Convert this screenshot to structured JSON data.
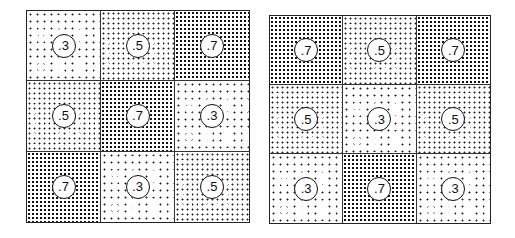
{
  "panels": [
    {
      "name": "left-panel",
      "cells": [
        {
          "label": ".3",
          "density": 3
        },
        {
          "label": ".5",
          "density": 5
        },
        {
          "label": ".7",
          "density": 7
        },
        {
          "label": ".5",
          "density": 5
        },
        {
          "label": ".7",
          "density": 7
        },
        {
          "label": ".3",
          "density": 3
        },
        {
          "label": ".7",
          "density": 7
        },
        {
          "label": ".3",
          "density": 3
        },
        {
          "label": ".5",
          "density": 5
        }
      ]
    },
    {
      "name": "right-panel",
      "cells": [
        {
          "label": ".7",
          "density": 7
        },
        {
          "label": ".5",
          "density": 5
        },
        {
          "label": ".7",
          "density": 7
        },
        {
          "label": ".5",
          "density": 5
        },
        {
          "label": ".3",
          "density": 3
        },
        {
          "label": ".5",
          "density": 5
        },
        {
          "label": ".3",
          "density": 3
        },
        {
          "label": ".7",
          "density": 7
        },
        {
          "label": ".3",
          "density": 3
        }
      ]
    }
  ]
}
